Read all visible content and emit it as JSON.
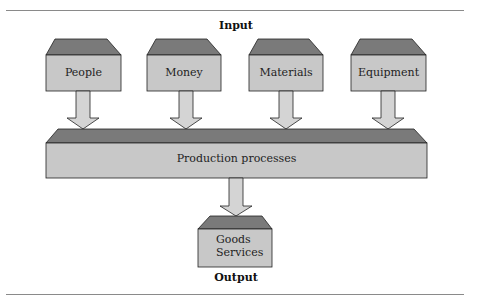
{
  "diagram": {
    "input_heading": "Input",
    "output_heading": "Output",
    "inputs": [
      {
        "label": "People"
      },
      {
        "label": "Money"
      },
      {
        "label": "Materials"
      },
      {
        "label": "Equipment"
      }
    ],
    "process": {
      "label": "Production processes"
    },
    "output": {
      "line1": "Goods",
      "line2": "Services"
    },
    "colors": {
      "box_face": "#c8c8c8",
      "box_top": "#7a7a7a",
      "arrow_fill": "#d4d4d4",
      "outline": "#222222"
    }
  }
}
